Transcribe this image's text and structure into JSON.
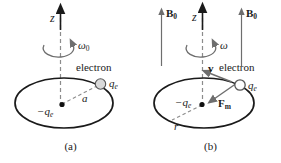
{
  "figure": {
    "title_present": false,
    "background_color": "#ffffff",
    "stroke_color": "#1a1a1a",
    "dash_color": "#8c8c8c",
    "arrow_gray": "#6e6e6e",
    "electron_fill": "#d9d9d9",
    "nucleus_fill": "#111111"
  },
  "panels": [
    {
      "id": "a",
      "caption": "(a)",
      "axis_label": "z",
      "angular_velocity_symbol": "ω",
      "angular_velocity_subscript": "0",
      "electron_label": "electron",
      "electron_charge_symbol": "q",
      "electron_charge_subscript": "e",
      "center_charge_symbol": "−q",
      "center_charge_subscript": "e",
      "radius_label": "a",
      "field_label": null,
      "velocity_label": null,
      "force_label": null
    },
    {
      "id": "b",
      "caption": "(b)",
      "axis_label": "z",
      "angular_velocity_symbol": "ω",
      "angular_velocity_subscript": "",
      "electron_label": "electron",
      "electron_charge_symbol": "q",
      "electron_charge_subscript": "e",
      "center_charge_symbol": "−q",
      "center_charge_subscript": "e",
      "radius_label": "r",
      "field_label_left": "B",
      "field_label_left_subscript": "0",
      "field_label_right": "B",
      "field_label_right_subscript": "0",
      "velocity_label": "v",
      "force_label": "F",
      "force_label_subscript": "m"
    }
  ]
}
